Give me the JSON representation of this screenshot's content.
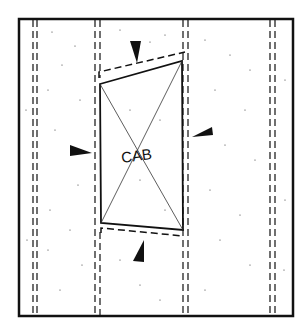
{
  "diagram": {
    "type": "architectural-plan-elevation",
    "label": "CAB",
    "colors": {
      "line": "#111111",
      "background": "#ffffff"
    },
    "studs": [
      {
        "name": "stud-1",
        "x": 35
      },
      {
        "name": "stud-2",
        "x": 97
      },
      {
        "name": "stud-3",
        "x": 185
      },
      {
        "name": "stud-4",
        "x": 272
      }
    ],
    "markers": [
      "top-arrow",
      "left-arrow",
      "right-arrow",
      "bottom-arrow"
    ]
  }
}
